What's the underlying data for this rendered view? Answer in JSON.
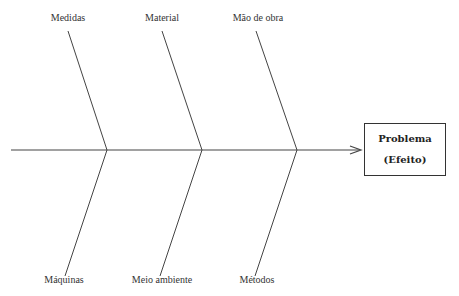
{
  "diagram": {
    "type": "ishikawa-fishbone",
    "effect": {
      "title": "Problema",
      "subtitle": "(Efeito)"
    },
    "causes_top": [
      {
        "label": "Medidas"
      },
      {
        "label": "Material"
      },
      {
        "label": "Mão de obra"
      }
    ],
    "causes_bottom": [
      {
        "label": "Máquinas"
      },
      {
        "label": "Meio ambiente"
      },
      {
        "label": "Métodos"
      }
    ],
    "colors": {
      "line": "#333333",
      "background": "#ffffff"
    }
  }
}
